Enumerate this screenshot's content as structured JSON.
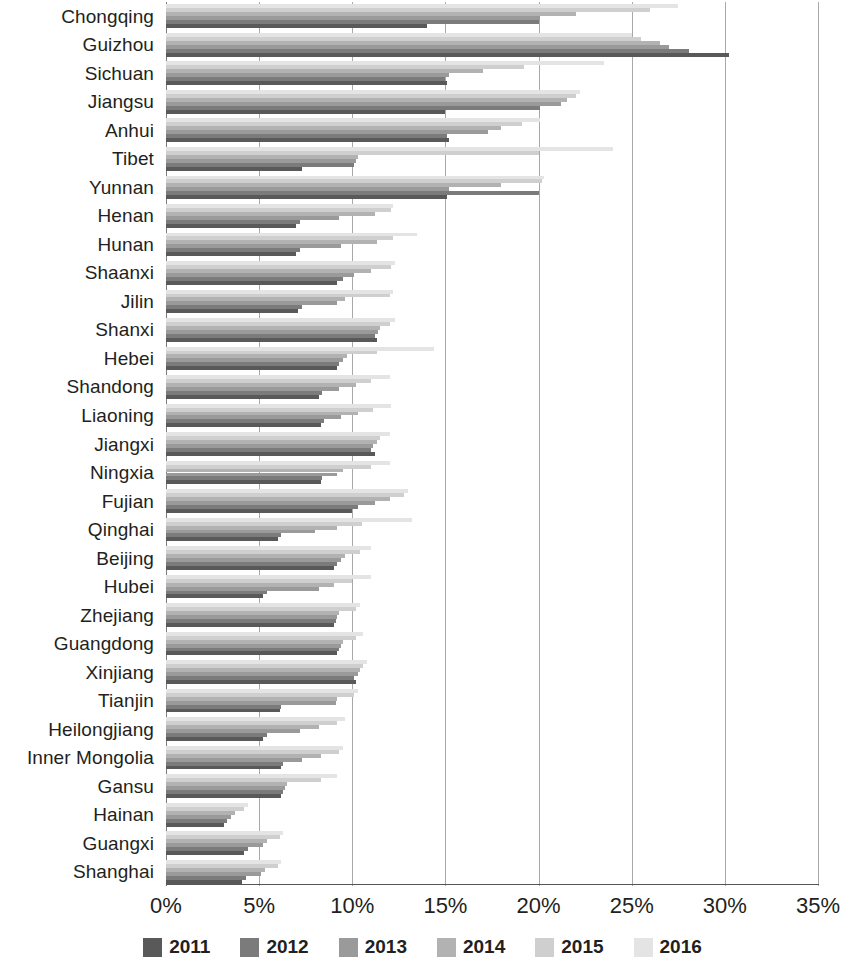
{
  "chart_data": {
    "type": "bar",
    "orientation": "horizontal",
    "title": "",
    "subtitle": "",
    "xlabel": "",
    "ylabel": "",
    "xlim": [
      0,
      35
    ],
    "xtick_labels": [
      "0%",
      "5%",
      "10%",
      "15%",
      "20%",
      "25%",
      "30%",
      "35%"
    ],
    "xtick_values": [
      0,
      5,
      10,
      15,
      20,
      25,
      30,
      35
    ],
    "grid": true,
    "grid_axis": "x",
    "legend_position": "bottom",
    "value_unit": "%",
    "categories": [
      "Chongqing",
      "Guizhou",
      "Sichuan",
      "Jiangsu",
      "Anhui",
      "Tibet",
      "Yunnan",
      "Henan",
      "Hunan",
      "Shaanxi",
      "Jilin",
      "Shanxi",
      "Hebei",
      "Shandong",
      "Liaoning",
      "Jiangxi",
      "Ningxia",
      "Fujian",
      "Qinghai",
      "Beijing",
      "Hubei",
      "Zhejiang",
      "Guangdong",
      "Xinjiang",
      "Tianjin",
      "Heilongjiang",
      "Inner Mongolia",
      "Gansu",
      "Hainan",
      "Guangxi",
      "Shanghai"
    ],
    "series": [
      {
        "name": "2011",
        "color": "#595959",
        "values": [
          14.0,
          30.2,
          15.1,
          15.0,
          15.2,
          7.3,
          15.1,
          7.0,
          7.0,
          9.2,
          7.1,
          11.3,
          9.2,
          8.2,
          8.3,
          11.2,
          8.3,
          10.0,
          6.0,
          9.0,
          5.2,
          9.0,
          9.2,
          10.2,
          6.1,
          5.2,
          6.2,
          6.2,
          3.1,
          4.2,
          4.1
        ]
      },
      {
        "name": "2012",
        "color": "#7b7b7b",
        "values": [
          20.0,
          28.1,
          15.0,
          20.1,
          15.1,
          10.1,
          20.0,
          7.2,
          7.2,
          9.5,
          7.3,
          11.2,
          9.3,
          8.4,
          8.5,
          11.0,
          8.4,
          10.3,
          6.2,
          9.2,
          5.4,
          9.1,
          9.3,
          10.1,
          6.2,
          5.4,
          6.3,
          6.3,
          3.3,
          4.4,
          4.3
        ]
      },
      {
        "name": "2013",
        "color": "#9a9a9a",
        "values": [
          20.1,
          27.0,
          15.2,
          21.2,
          17.3,
          10.2,
          15.2,
          9.3,
          9.4,
          10.1,
          9.2,
          11.4,
          9.5,
          9.3,
          9.4,
          11.1,
          9.2,
          11.2,
          8.0,
          9.4,
          8.2,
          9.2,
          9.4,
          10.3,
          9.1,
          7.2,
          7.3,
          6.4,
          3.5,
          5.2,
          5.1
        ]
      },
      {
        "name": "2014",
        "color": "#b2b2b2",
        "values": [
          22.0,
          26.5,
          17.0,
          21.5,
          18.0,
          10.3,
          18.0,
          11.2,
          11.3,
          11.0,
          9.6,
          11.5,
          9.7,
          10.2,
          10.3,
          11.3,
          9.5,
          12.0,
          9.2,
          9.6,
          9.0,
          9.3,
          9.5,
          10.4,
          9.2,
          8.2,
          8.3,
          6.5,
          3.7,
          5.4,
          5.3
        ]
      },
      {
        "name": "2015",
        "color": "#cfcfcf",
        "values": [
          26.0,
          25.5,
          19.2,
          22.0,
          19.1,
          20.0,
          20.2,
          12.1,
          12.2,
          12.1,
          12.0,
          12.0,
          11.3,
          11.0,
          11.1,
          11.5,
          11.0,
          12.8,
          10.5,
          10.4,
          10.0,
          10.2,
          10.2,
          10.6,
          10.1,
          9.2,
          9.3,
          8.3,
          4.2,
          6.1,
          6.0
        ]
      },
      {
        "name": "2016",
        "color": "#e4e4e4",
        "values": [
          27.5,
          25.0,
          23.5,
          22.2,
          20.1,
          24.0,
          20.3,
          12.2,
          13.5,
          12.3,
          12.2,
          12.3,
          14.4,
          12.0,
          12.1,
          12.0,
          12.0,
          13.0,
          13.2,
          11.0,
          11.0,
          10.4,
          10.6,
          10.8,
          10.3,
          9.6,
          9.5,
          9.2,
          4.4,
          6.3,
          6.2
        ]
      }
    ]
  }
}
